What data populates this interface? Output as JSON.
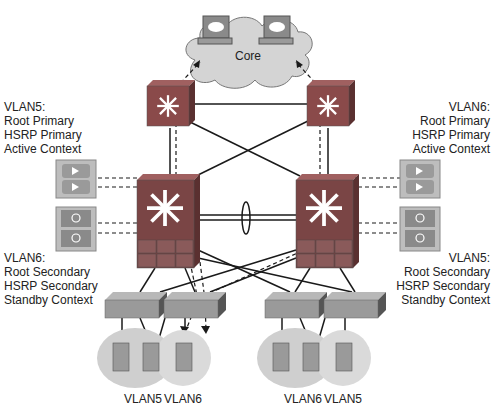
{
  "diagram": {
    "core": {
      "label": "Core"
    },
    "left_top_annotation": [
      "VLAN5:",
      "Root Primary",
      "HSRP Primary",
      "Active Context"
    ],
    "right_top_annotation": [
      "VLAN6:",
      "Root Primary",
      "HSRP Primary",
      "Active Context"
    ],
    "left_bottom_annotation": [
      "VLAN6:",
      "Root Secondary",
      "HSRP Secondary",
      "Standby Context"
    ],
    "right_bottom_annotation": [
      "VLAN5:",
      "Root Secondary",
      "HSRP Secondary",
      "Standby Context"
    ],
    "vlan_labels": {
      "left_a": "VLAN5",
      "left_b": "VLAN6",
      "right_a": "VLAN6",
      "right_b": "VLAN5"
    },
    "colors": {
      "device_red": "#8a4a4a",
      "device_face": "#7a5a5a",
      "cloud": "#d4d4d4",
      "vlan_ellipse": "#cfcfcf",
      "appliance": "#bdbdbd",
      "switch_gray": "#9a9a9a",
      "link": "#1a1a1a"
    }
  }
}
